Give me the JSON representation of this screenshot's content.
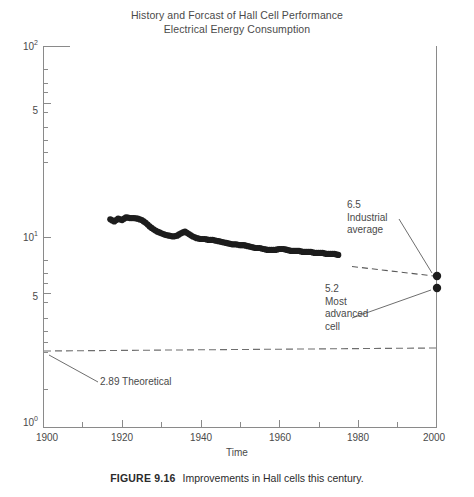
{
  "figure": {
    "caption_number": "FIGURE 9.16",
    "caption_text": "Improvements in Hall cells this century."
  },
  "chart_data": {
    "type": "line",
    "title": "History and Forcast of Hall Cell Performance",
    "subtitle": "Electrical Energy Consumption",
    "xlabel": "Time",
    "ylabel": "",
    "xlim": [
      1900,
      2000
    ],
    "ylim": [
      1,
      100
    ],
    "yscale": "log",
    "xscale": "linear",
    "grid": false,
    "legend": "none",
    "xticks": [
      1900,
      1920,
      1940,
      1960,
      1980,
      2000
    ],
    "xtick_labels": [
      "1900",
      "1920",
      "1940",
      "1960",
      "1980",
      "2000"
    ],
    "xminor_ticks": [
      1910,
      1930,
      1950,
      1970,
      1990
    ],
    "yticks": [
      1,
      5,
      10,
      50,
      100
    ],
    "ytick_labels": [
      "10⁰",
      "5",
      "10¹",
      "5",
      "10²"
    ],
    "series": [
      {
        "name": "Hall cell energy consumption (measured)",
        "style": "filled-circle-markers",
        "x": [
          1917,
          1918,
          1919,
          1920,
          1921,
          1922,
          1923,
          1924,
          1925,
          1926,
          1927,
          1928,
          1929,
          1930,
          1931,
          1932,
          1933,
          1934,
          1935,
          1936,
          1937,
          1938,
          1939,
          1940,
          1941,
          1942,
          1943,
          1944,
          1945,
          1946,
          1947,
          1948,
          1949,
          1950,
          1951,
          1952,
          1953,
          1954,
          1955,
          1956,
          1957,
          1958,
          1959,
          1960,
          1961,
          1962,
          1963,
          1964,
          1965,
          1966,
          1967,
          1968,
          1969,
          1970,
          1971,
          1972,
          1973,
          1974,
          1975
        ],
        "values": [
          12.3,
          12.0,
          12.4,
          12.2,
          12.6,
          12.5,
          12.5,
          12.4,
          12.2,
          11.8,
          11.3,
          10.9,
          10.6,
          10.4,
          10.2,
          10.1,
          10.0,
          10.1,
          10.4,
          10.6,
          10.3,
          10.0,
          9.8,
          9.7,
          9.7,
          9.6,
          9.6,
          9.5,
          9.4,
          9.3,
          9.2,
          9.1,
          9.1,
          9.0,
          9.0,
          8.9,
          8.8,
          8.7,
          8.7,
          8.6,
          8.5,
          8.5,
          8.5,
          8.6,
          8.6,
          8.5,
          8.4,
          8.4,
          8.4,
          8.3,
          8.3,
          8.3,
          8.2,
          8.2,
          8.2,
          8.1,
          8.1,
          8.1,
          8.0
        ]
      },
      {
        "name": "Forecast to industrial average",
        "style": "dashed-line",
        "x": [
          1975,
          2000
        ],
        "values": [
          8.0,
          6.5
        ]
      },
      {
        "name": "Theoretical minimum",
        "style": "dashed-horizontal-line",
        "x": [
          1900,
          2000
        ],
        "values": [
          2.89,
          2.89
        ]
      }
    ],
    "points": [
      {
        "name": "industrial-average",
        "x": 2000,
        "value": 6.5,
        "label": "6.5 Industrial average"
      },
      {
        "name": "most-advanced-cell",
        "x": 2000,
        "value": 5.2,
        "label": "5.2 Most advanced cell"
      }
    ],
    "annotations": [
      {
        "name": "industrial-average",
        "lines": [
          "6.5",
          "Industrial",
          "average"
        ],
        "target_x": 2000,
        "target_value": 6.5
      },
      {
        "name": "most-advanced-cell",
        "lines": [
          "5.2",
          "Most",
          "advanced",
          "cell"
        ],
        "target_x": 2000,
        "target_value": 5.2
      },
      {
        "name": "theoretical",
        "lines": [
          "2.89 Theoretical"
        ],
        "target_x": 1900,
        "target_value": 2.89
      }
    ]
  }
}
